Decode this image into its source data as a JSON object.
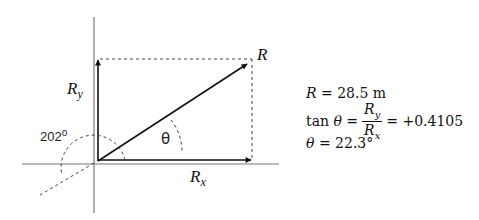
{
  "diagram": {
    "labels": {
      "R": "R",
      "Ry_base": "R",
      "Ry_sub": "y",
      "Rx_base": "R",
      "Rx_sub": "x",
      "theta": "θ",
      "angle_value": "202",
      "angle_unit": "o"
    },
    "colors": {
      "axis": "#777777",
      "vector": "#111111",
      "dashed": "#444444"
    }
  },
  "equations": {
    "line1": {
      "lhs": "R",
      "rhs": "= 28.5 m"
    },
    "line2": {
      "lhs_fn": "tan",
      "lhs_var": "θ",
      "equals1": "=",
      "num_base": "R",
      "num_sub": "y",
      "den_base": "R",
      "den_sub": "x",
      "rhs": "= +0.4105"
    },
    "line3": {
      "lhs": "θ",
      "rhs": "= 22.3°"
    }
  }
}
